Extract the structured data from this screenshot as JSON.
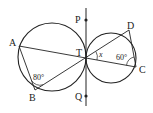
{
  "diagram": {
    "type": "geometry",
    "points": {
      "A": {
        "label": "A",
        "x": 19,
        "y": 46
      },
      "B": {
        "label": "B",
        "x": 35,
        "y": 90
      },
      "T": {
        "label": "T",
        "x": 86,
        "y": 58
      },
      "D": {
        "label": "D",
        "x": 129,
        "y": 30
      },
      "C": {
        "label": "C",
        "x": 136,
        "y": 67
      },
      "P": {
        "label": "P",
        "x": 86,
        "y": 20
      },
      "Q": {
        "label": "Q",
        "x": 86,
        "y": 96
      }
    },
    "circles": [
      {
        "name": "left",
        "cx": 52,
        "cy": 57,
        "r": 34
      },
      {
        "name": "right",
        "cx": 111,
        "cy": 58,
        "r": 25
      }
    ],
    "angles": {
      "B": "80°",
      "C": "60°",
      "x": "x"
    }
  }
}
